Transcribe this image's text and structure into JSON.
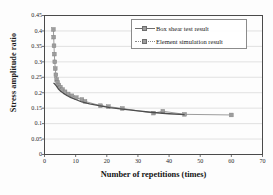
{
  "chart_data": {
    "type": "scatter",
    "title": "",
    "xlabel": "Number of repetitions (times)",
    "ylabel": "Stress amplitude ratio",
    "xlim": [
      0,
      70
    ],
    "ylim": [
      0,
      0.45
    ],
    "xticks": [
      0,
      10,
      20,
      30,
      40,
      50,
      60,
      70
    ],
    "xticklabels": [
      "0",
      "10",
      "20",
      "30",
      "40",
      "50",
      "60",
      "70"
    ],
    "yticks": [
      0,
      0.05,
      0.1,
      0.15,
      0.2,
      0.25,
      0.3,
      0.35,
      0.4,
      0.45
    ],
    "yticklabels": [
      "0",
      "0.05",
      "0.1",
      "0.15",
      "0.2",
      "0.25",
      "0.3",
      "0.35",
      "0.4",
      "0.45"
    ],
    "grid": "horizontal",
    "legend_position": "upper-right-inside",
    "series": [
      {
        "name": "Box shear test result",
        "marker": "square",
        "color": "#7a7a7a",
        "line_color": "#4d4d4d",
        "points": [
          {
            "x": 2.9,
            "y": 0.232
          },
          {
            "x": 3.3,
            "y": 0.228
          },
          {
            "x": 3.8,
            "y": 0.222
          },
          {
            "x": 4.4,
            "y": 0.213
          },
          {
            "x": 5.2,
            "y": 0.205
          },
          {
            "x": 6.1,
            "y": 0.198
          },
          {
            "x": 7.2,
            "y": 0.191
          },
          {
            "x": 8.5,
            "y": 0.184
          },
          {
            "x": 10.0,
            "y": 0.178
          },
          {
            "x": 12.0,
            "y": 0.17
          },
          {
            "x": 14.5,
            "y": 0.164
          },
          {
            "x": 17.5,
            "y": 0.158
          },
          {
            "x": 21.0,
            "y": 0.152
          },
          {
            "x": 25.0,
            "y": 0.147
          },
          {
            "x": 30.0,
            "y": 0.141
          },
          {
            "x": 35.0,
            "y": 0.136
          },
          {
            "x": 40.0,
            "y": 0.132
          },
          {
            "x": 45.0,
            "y": 0.129
          }
        ]
      },
      {
        "name": "Element simulation result",
        "marker": "square",
        "color": "#9d9d9d",
        "line_color": "#9d9d9d",
        "points": [
          {
            "x": 2.85,
            "y": 0.405
          },
          {
            "x": 2.95,
            "y": 0.38
          },
          {
            "x": 3.05,
            "y": 0.352
          },
          {
            "x": 3.15,
            "y": 0.325
          },
          {
            "x": 3.3,
            "y": 0.3
          },
          {
            "x": 3.45,
            "y": 0.278
          },
          {
            "x": 3.65,
            "y": 0.258
          },
          {
            "x": 3.9,
            "y": 0.243
          },
          {
            "x": 4.2,
            "y": 0.233
          },
          {
            "x": 4.6,
            "y": 0.225
          },
          {
            "x": 5.1,
            "y": 0.218
          },
          {
            "x": 5.8,
            "y": 0.21
          },
          {
            "x": 6.6,
            "y": 0.203
          },
          {
            "x": 7.6,
            "y": 0.196
          },
          {
            "x": 8.8,
            "y": 0.19
          },
          {
            "x": 10.2,
            "y": 0.184
          },
          {
            "x": 12.0,
            "y": 0.178
          },
          {
            "x": 13.0,
            "y": 0.172
          },
          {
            "x": 18.0,
            "y": 0.158
          },
          {
            "x": 20.5,
            "y": 0.155
          },
          {
            "x": 25.0,
            "y": 0.149
          },
          {
            "x": 35.0,
            "y": 0.134
          },
          {
            "x": 38.0,
            "y": 0.14
          },
          {
            "x": 45.0,
            "y": 0.13
          },
          {
            "x": 60.0,
            "y": 0.128
          }
        ]
      }
    ]
  },
  "legend": {
    "items": [
      {
        "label": "Box shear test result"
      },
      {
        "label": "Element simulation result"
      }
    ]
  },
  "colors": {
    "frame": "#4a4a4a",
    "grid": "#d6d6d6",
    "series_test": "#7a7a7a",
    "series_sim": "#9d9d9d",
    "text": "#1b1b1b"
  }
}
